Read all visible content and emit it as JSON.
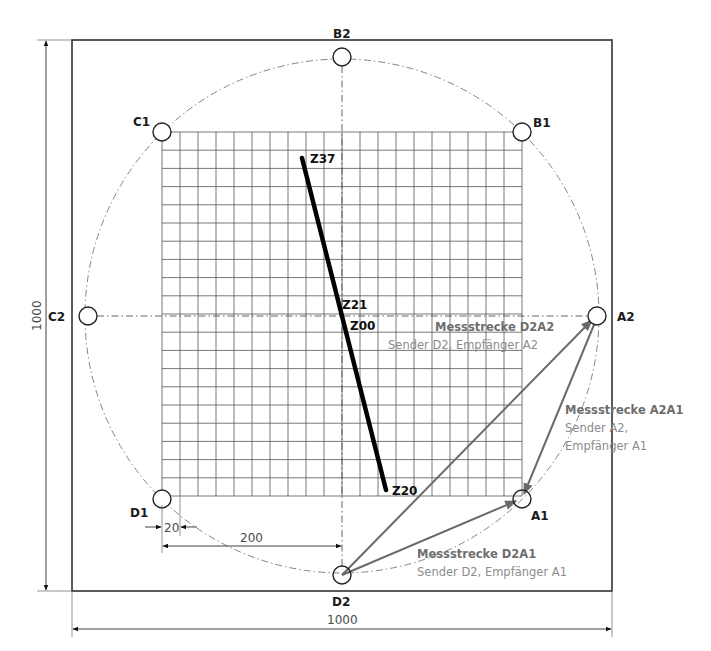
{
  "diagram": {
    "frame": {
      "width_dim": "1000",
      "height_dim": "1000"
    },
    "sensors": [
      {
        "id": "A1",
        "label": "A1"
      },
      {
        "id": "A2",
        "label": "A2"
      },
      {
        "id": "B1",
        "label": "B1"
      },
      {
        "id": "B2",
        "label": "B2"
      },
      {
        "id": "C1",
        "label": "C1"
      },
      {
        "id": "C2",
        "label": "C2"
      },
      {
        "id": "D1",
        "label": "D1"
      },
      {
        "id": "D2",
        "label": "D2"
      }
    ],
    "grid": {
      "cells_x": 20,
      "cells_y": 20
    },
    "dimensions": {
      "cell": "20",
      "offset": "200",
      "bottom": "1000",
      "left": "1000"
    },
    "z_points": {
      "z37": "Z37",
      "z21": "Z21",
      "z00": "Z00",
      "z20": "Z20"
    },
    "paths": [
      {
        "title": "Messstrecke D2A2",
        "subtitle": "Sender D2, Empfänger A2"
      },
      {
        "title": "Messstrecke A2A1",
        "subtitle_line1": "Sender A2,",
        "subtitle_line2": "Empfänger A1"
      },
      {
        "title": "Messstrecke D2A1",
        "subtitle": "Sender D2, Empfänger A1"
      }
    ],
    "colors": {
      "frame": "#333333",
      "grid": "#555555",
      "arrow": "#6a6a6a",
      "zline": "#000000"
    }
  }
}
